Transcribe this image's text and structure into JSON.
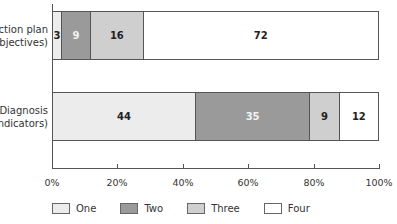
{
  "chart_data": {
    "type": "bar",
    "orientation": "horizontal",
    "stacked": true,
    "percent": true,
    "title": "",
    "xlabel": "",
    "ylabel": "",
    "categories": [
      "Action plan (objectives)",
      "Diagnosis (indicators)"
    ],
    "category_lines": [
      [
        "Action plan",
        "(objectives)"
      ],
      [
        "Diagnosis",
        "(indicators)"
      ]
    ],
    "series": [
      {
        "name": "One",
        "values": [
          3,
          44
        ],
        "color": "#ececec",
        "label_color": "#222222"
      },
      {
        "name": "Two",
        "values": [
          9,
          35
        ],
        "color": "#9a9a9a",
        "label_color": "#f2f2f2"
      },
      {
        "name": "Three",
        "values": [
          16,
          9
        ],
        "color": "#cfcfcf",
        "label_color": "#222222"
      },
      {
        "name": "Four",
        "values": [
          72,
          12
        ],
        "color": "#ffffff",
        "label_color": "#222222"
      }
    ],
    "xticks": [
      "0%",
      "20%",
      "40%",
      "60%",
      "80%",
      "100%"
    ],
    "xlim": [
      0,
      100
    ],
    "grid": false,
    "legend_position": "bottom"
  }
}
